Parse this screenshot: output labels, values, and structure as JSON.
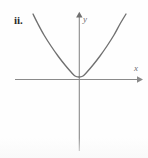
{
  "figure": {
    "item_label": "ii.",
    "y_axis_label": "y",
    "x_axis_label": "x",
    "curve_color": "#707070",
    "axis_color": "#8a8a8a",
    "label_color": "#2b2b2b",
    "background_color": "#fefefe"
  },
  "chart_data": {
    "type": "line",
    "title": "ii.",
    "xlabel": "x",
    "ylabel": "y",
    "grid": false,
    "legend": null,
    "annotations": [
      "ii."
    ],
    "axes": {
      "x_axis_pixel_y": 79,
      "y_axis_pixel_x": 79,
      "x_axis_from_pixel_x": 15,
      "x_axis_to_pixel_x": 140,
      "y_axis_from_pixel_y": 14,
      "y_axis_to_pixel_y": 151,
      "x_arrow": "right",
      "y_arrow": "up",
      "tick_labels_x": [],
      "tick_labels_y": []
    },
    "series": [
      {
        "name": "parabola",
        "description": "upward-opening parabola with vertex on the x-axis at the origin",
        "function": "y = a*x^2, a > 0, vertex at (0, 0)",
        "vertex": [
          0,
          0
        ],
        "opens": "up",
        "x": [
          -2.3,
          -2.0,
          -1.6,
          -1.2,
          -0.8,
          -0.4,
          0.0,
          0.4,
          0.8,
          1.2,
          1.6,
          2.0,
          2.3
        ],
        "y": [
          4.9,
          3.7,
          2.4,
          1.35,
          0.6,
          0.15,
          0.0,
          0.15,
          0.6,
          1.35,
          2.4,
          3.7,
          4.9
        ],
        "pixel_points": [
          [
            33,
            14
          ],
          [
            38,
            24
          ],
          [
            44,
            35
          ],
          [
            51,
            46
          ],
          [
            58,
            56
          ],
          [
            65,
            65
          ],
          [
            71,
            72
          ],
          [
            75,
            76
          ],
          [
            79,
            77
          ],
          [
            83,
            76
          ],
          [
            87,
            72
          ],
          [
            93,
            65
          ],
          [
            100,
            56
          ],
          [
            107,
            46
          ],
          [
            114,
            35
          ],
          [
            120,
            24
          ],
          [
            126,
            14
          ]
        ]
      }
    ]
  }
}
